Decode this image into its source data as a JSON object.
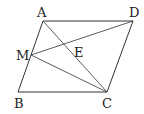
{
  "diagram": {
    "type": "geometry",
    "shape": "parallelogram ABCD",
    "points": {
      "A": {
        "label": "A",
        "x": 43,
        "y": 21
      },
      "D": {
        "label": "D",
        "x": 133,
        "y": 21
      },
      "B": {
        "label": "B",
        "x": 18,
        "y": 92
      },
      "C": {
        "label": "C",
        "x": 107,
        "y": 92
      },
      "M": {
        "label": "M",
        "x": 31,
        "y": 55
      },
      "E": {
        "label": "E"
      }
    },
    "segments": [
      "AD",
      "AB",
      "BC",
      "CD",
      "AC",
      "MD",
      "MC"
    ],
    "line_color": "#333333"
  }
}
